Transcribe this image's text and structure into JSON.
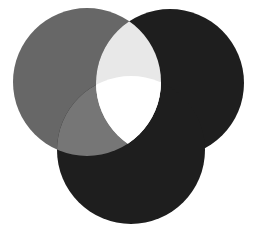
{
  "diagram": {
    "type": "venn",
    "width": 253,
    "height": 237,
    "background": "#ffffff",
    "circles": [
      {
        "id": "left",
        "cx": 87,
        "cy": 82,
        "r": 74,
        "color": "#676767"
      },
      {
        "id": "right",
        "cx": 170,
        "cy": 83,
        "r": 74,
        "color": "#1e1e1e"
      },
      {
        "id": "bottom",
        "cx": 131,
        "cy": 150,
        "r": 74,
        "color": "#1e1e1e"
      }
    ],
    "regions": {
      "left_right": "#e8e8e8",
      "left_right_bottom": "#ffffff",
      "left_bottom": "#767676",
      "right_bottom": "#1e1e1e"
    }
  }
}
